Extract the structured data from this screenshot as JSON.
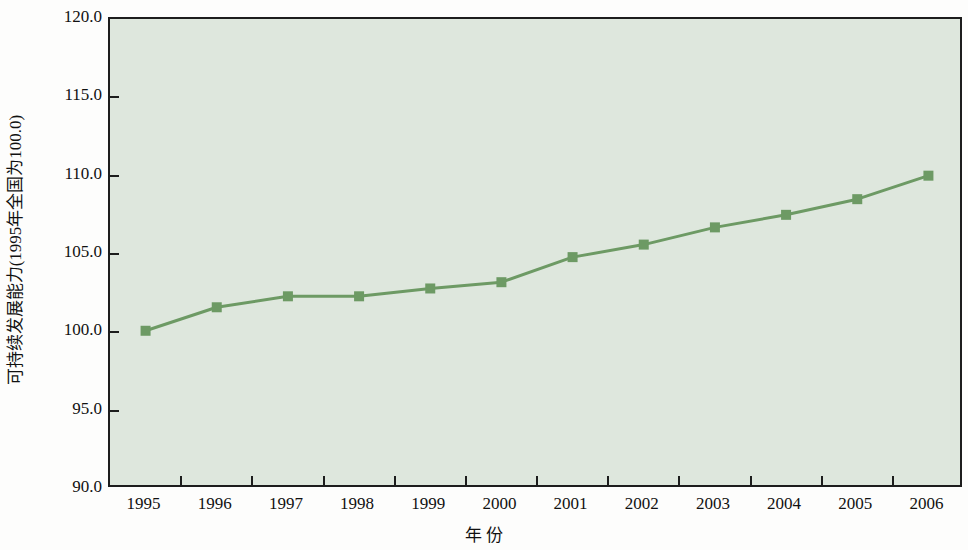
{
  "chart_data": {
    "type": "line",
    "title": "",
    "subtitle": "",
    "xlabel": "年 份",
    "ylabel": "可持续发展能力(1995年全国为100.0)",
    "categories": [
      "1995",
      "1996",
      "1997",
      "1998",
      "1999",
      "2000",
      "2001",
      "2002",
      "2003",
      "2004",
      "2005",
      "2006"
    ],
    "x": [
      1995,
      1996,
      1997,
      1998,
      1999,
      2000,
      2001,
      2002,
      2003,
      2004,
      2005,
      2006
    ],
    "series": [
      {
        "name": "可持续发展能力",
        "values": [
          100.1,
          101.6,
          102.3,
          102.3,
          102.8,
          103.2,
          104.8,
          105.6,
          106.7,
          107.5,
          108.5,
          110.0
        ]
      }
    ],
    "values": [
      100.1,
      101.6,
      102.3,
      102.3,
      102.8,
      103.2,
      104.8,
      105.6,
      106.7,
      107.5,
      108.5,
      110.0
    ],
    "ylim": [
      90.0,
      120.0
    ],
    "ytick_labels": [
      "120.0",
      "115.0",
      "110.0",
      "105.0",
      "100.0",
      "95.0",
      "90.0"
    ],
    "ytick_values": [
      120.0,
      115.0,
      110.0,
      105.0,
      100.0,
      95.0,
      90.0
    ],
    "xtick_labels": [
      "1995",
      "1996",
      "1997",
      "1998",
      "1999",
      "2000",
      "2001",
      "2002",
      "2003",
      "2004",
      "2005",
      "2006"
    ],
    "grid": false,
    "legend": "none",
    "marker": "square",
    "line_color": "#6d9a64",
    "marker_color": "#6d9a64",
    "plot_background_color": "#dee7dd",
    "axis_color": "#1d1d1d",
    "figure_background_color": "#fdfdfc"
  }
}
